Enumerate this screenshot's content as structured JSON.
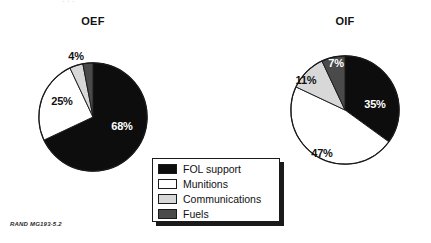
{
  "figure": {
    "attribution": "RAND MG193-5.2",
    "top_clipped_text": ". .        ."
  },
  "legend": {
    "position": "center-bottom",
    "entries": [
      {
        "label": "FOL support",
        "color": "#0d0d0d",
        "key": "fol"
      },
      {
        "label": "Munitions",
        "color": "#ffffff",
        "key": "munitions"
      },
      {
        "label": "Communications",
        "color": "#d8d8d8",
        "key": "communications"
      },
      {
        "label": "Fuels",
        "color": "#4a4a4a",
        "key": "fuels"
      }
    ]
  },
  "colors": {
    "fol_support": "#0d0d0d",
    "munitions": "#ffffff",
    "communications": "#d8d8d8",
    "fuels": "#4a4a4a",
    "outline": "#1a1a1a",
    "background": "#ffffff"
  },
  "charts": {
    "oef": {
      "title": "OEF",
      "labels": {
        "fol": "68%",
        "munitions": "25%",
        "communications": "4%",
        "fuels": "3%"
      }
    },
    "oif": {
      "title": "OIF",
      "labels": {
        "fol": "35%",
        "munitions": "47%",
        "communications": "11%",
        "fuels": "7%"
      }
    }
  },
  "chart_data": [
    {
      "type": "pie",
      "title": "OEF",
      "categories": [
        "FOL support",
        "Munitions",
        "Communications",
        "Fuels"
      ],
      "values": [
        68,
        25,
        4,
        3
      ],
      "value_labels": [
        "68%",
        "25%",
        "4%",
        "3%"
      ],
      "colors": [
        "#0d0d0d",
        "#ffffff",
        "#d8d8d8",
        "#4a4a4a"
      ],
      "units": "percent",
      "start_angle_deg": 0,
      "direction": "clockwise",
      "legend": "shared, center-bottom",
      "grid": false,
      "xlabel": "",
      "ylabel": ""
    },
    {
      "type": "pie",
      "title": "OIF",
      "categories": [
        "FOL support",
        "Munitions",
        "Communications",
        "Fuels"
      ],
      "values": [
        35,
        47,
        11,
        7
      ],
      "value_labels": [
        "35%",
        "47%",
        "11%",
        "7%"
      ],
      "colors": [
        "#0d0d0d",
        "#ffffff",
        "#d8d8d8",
        "#4a4a4a"
      ],
      "units": "percent",
      "start_angle_deg": 0,
      "direction": "clockwise",
      "legend": "shared, center-bottom",
      "grid": false,
      "xlabel": "",
      "ylabel": ""
    }
  ]
}
